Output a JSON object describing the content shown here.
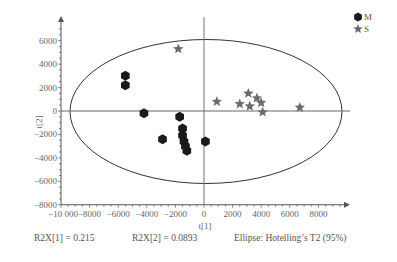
{
  "chart_data": {
    "type": "scatter",
    "title": "",
    "xlabel": "t[1]",
    "ylabel": "t[2]",
    "xlim": [
      -10000,
      10000
    ],
    "ylim": [
      -8000,
      7000
    ],
    "x_ticks": [
      -10000,
      -8000,
      -6000,
      -4000,
      -2000,
      0,
      2000,
      4000,
      6000,
      8000
    ],
    "x_tick_labels": [
      "−10 000",
      "−8000",
      "−6000",
      "−4000",
      "−2000",
      "0",
      "2000",
      "4000",
      "6000",
      "8000"
    ],
    "y_ticks": [
      6000,
      4000,
      2000,
      0,
      -2000,
      -4000,
      -6000,
      -8000
    ],
    "y_tick_labels": [
      "6000",
      "4000",
      "2000",
      "0",
      "−2000",
      "−4000",
      "−6000",
      "−8000"
    ],
    "grid": false,
    "legend_position": "top-right",
    "series": [
      {
        "name": "M",
        "marker": "hexagon",
        "color": "#1a1a1a",
        "points": [
          {
            "x": -5500,
            "y": 3000
          },
          {
            "x": -5500,
            "y": 2200
          },
          {
            "x": -4200,
            "y": -200
          },
          {
            "x": -1700,
            "y": -500
          },
          {
            "x": -1500,
            "y": -1500
          },
          {
            "x": -1500,
            "y": -2100
          },
          {
            "x": -1400,
            "y": -2600
          },
          {
            "x": -1300,
            "y": -3000
          },
          {
            "x": -1200,
            "y": -3400
          },
          {
            "x": -2900,
            "y": -2400
          },
          {
            "x": 100,
            "y": -2600
          }
        ]
      },
      {
        "name": "S",
        "marker": "star",
        "color": "#6b6b6b",
        "points": [
          {
            "x": -1800,
            "y": 5300
          },
          {
            "x": 900,
            "y": 800
          },
          {
            "x": 2500,
            "y": 600
          },
          {
            "x": 3100,
            "y": 1500
          },
          {
            "x": 3200,
            "y": 400
          },
          {
            "x": 3700,
            "y": 1100
          },
          {
            "x": 4000,
            "y": 700
          },
          {
            "x": 4100,
            "y": -100
          },
          {
            "x": 6700,
            "y": 300
          }
        ]
      }
    ],
    "ellipse": {
      "label": "Hotelling's T2 (95%)",
      "cx": 0,
      "cy": 0,
      "rx": 9500,
      "ry": 6100
    },
    "annotations": [
      "R2X[1] = 0.215",
      "R2X[2] = 0.0893",
      "Ellipse: Hotelling’s T2 (95%)"
    ]
  },
  "legend": {
    "items": [
      {
        "label": "M",
        "icon": "hexagon-marker"
      },
      {
        "label": "S",
        "icon": "star-marker"
      }
    ]
  },
  "footer": {
    "r2x1": "R2X[1] = 0.215",
    "r2x2": "R2X[2] = 0.0893",
    "ellipse": "Ellipse: Hotelling’s T2 (95%)"
  },
  "colors": {
    "axis": "#555555",
    "ellipse": "#333333",
    "m_marker": "#1a1a1a",
    "s_marker": "#6b6b6b"
  }
}
